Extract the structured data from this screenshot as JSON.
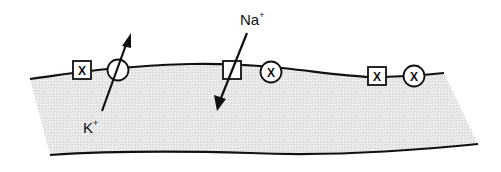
{
  "diagram": {
    "type": "membrane-ion-channel-schematic",
    "labels": {
      "potassium": {
        "base": "K",
        "charge": "+"
      },
      "sodium": {
        "base": "Na",
        "charge": "+"
      }
    },
    "channel_symbols": {
      "blocked_mark": "X"
    },
    "elements": [
      {
        "kind": "square",
        "state": "blocked",
        "mark": "X"
      },
      {
        "kind": "circle",
        "state": "open",
        "ion": "K+",
        "flux": "outward"
      },
      {
        "kind": "square",
        "state": "open",
        "ion": "Na+",
        "flux": "inward"
      },
      {
        "kind": "circle",
        "state": "blocked",
        "mark": "X"
      },
      {
        "kind": "square",
        "state": "blocked",
        "mark": "X"
      },
      {
        "kind": "circle",
        "state": "blocked",
        "mark": "X"
      }
    ],
    "colors": {
      "membrane_fill": "#e6e6e6",
      "line": "#111111",
      "background": "#ffffff"
    }
  }
}
